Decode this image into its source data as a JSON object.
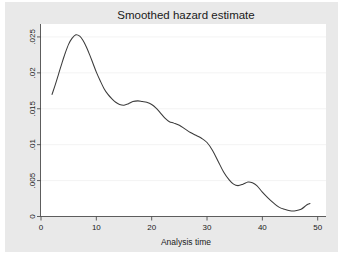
{
  "figure": {
    "background_color": "#ffffff",
    "panel_color": "#e9e9e9",
    "plot_area_color": "#ffffff"
  },
  "chart_data": {
    "type": "line",
    "title": "Smoothed hazard estimate",
    "xlabel": "Analysis time",
    "ylabel": "",
    "xlim": [
      0,
      51.5
    ],
    "ylim": [
      0,
      0.0268
    ],
    "xticks": [
      0,
      10,
      20,
      30,
      40,
      50
    ],
    "xtick_labels": [
      "0",
      "10",
      "20",
      "30",
      "40",
      "50"
    ],
    "yticks": [
      0,
      0.005,
      0.01,
      0.015,
      0.02,
      0.025
    ],
    "ytick_labels": [
      "0",
      ".005",
      ".01",
      ".015",
      ".02",
      ".025"
    ],
    "grid": "horizontal",
    "grid_color": "#f2f2f2",
    "legend": "none",
    "series": [
      {
        "name": "smoothed hazard",
        "color": "#3b3b3b",
        "x": [
          2.0,
          2.6,
          3.2,
          3.8,
          4.4,
          5.0,
          5.6,
          6.3,
          7.0,
          7.6,
          8.2,
          8.8,
          9.4,
          10.0,
          10.7,
          11.4,
          12.1,
          12.8,
          13.5,
          14.2,
          15.0,
          15.8,
          16.6,
          17.5,
          18.3,
          19.1,
          20.0,
          20.8,
          21.6,
          22.4,
          23.2,
          24.0,
          25.0,
          26.0,
          27.0,
          28.0,
          29.0,
          30.0,
          31.0,
          32.0,
          33.0,
          34.0,
          34.8,
          35.6,
          36.5,
          37.4,
          38.2,
          39.0,
          40.0,
          41.0,
          42.0,
          43.0,
          44.0,
          45.0,
          46.0,
          47.0,
          48.0,
          48.6
        ],
        "y": [
          0.017,
          0.0184,
          0.0199,
          0.0214,
          0.0228,
          0.024,
          0.0248,
          0.0253,
          0.0251,
          0.0245,
          0.0236,
          0.0225,
          0.0213,
          0.0201,
          0.0189,
          0.0178,
          0.017,
          0.0164,
          0.0159,
          0.0156,
          0.0155,
          0.0157,
          0.016,
          0.0161,
          0.016,
          0.0159,
          0.0156,
          0.0151,
          0.0144,
          0.0137,
          0.0132,
          0.013,
          0.0127,
          0.0122,
          0.0117,
          0.0113,
          0.0109,
          0.0103,
          0.0092,
          0.0077,
          0.0062,
          0.0051,
          0.0045,
          0.0043,
          0.0045,
          0.0048,
          0.0047,
          0.0043,
          0.0034,
          0.0026,
          0.0019,
          0.0013,
          0.001,
          0.0008,
          0.0008,
          0.001,
          0.0016,
          0.0018
        ]
      }
    ]
  }
}
